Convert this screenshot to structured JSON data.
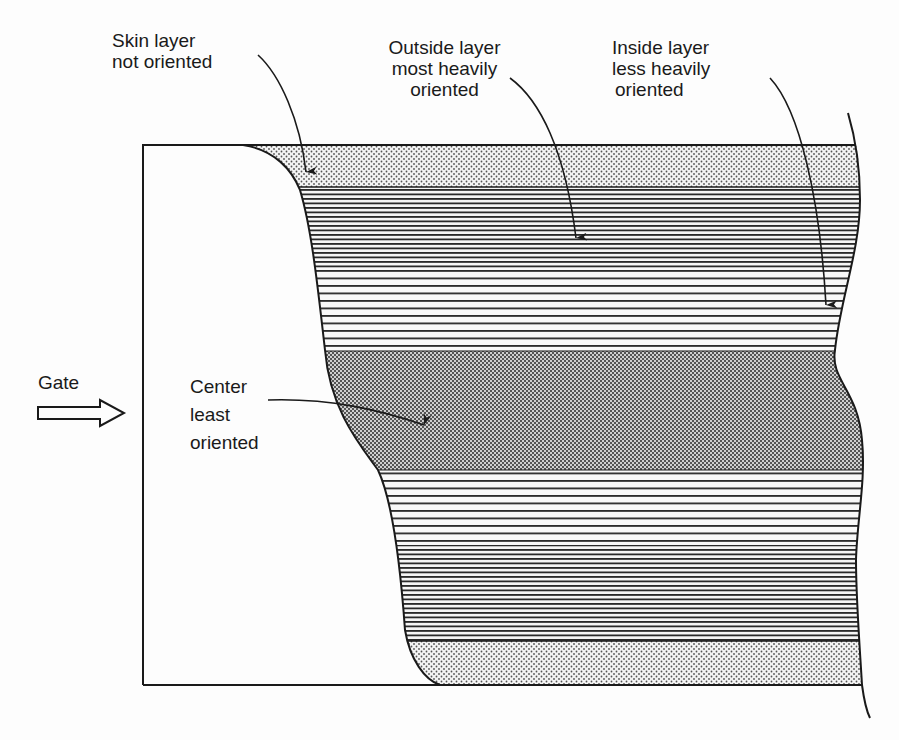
{
  "diagram": {
    "labels": {
      "skin": {
        "lines": [
          "Skin layer",
          "not oriented"
        ]
      },
      "outside": {
        "lines": [
          "Outside layer",
          "most heavily",
          "oriented"
        ]
      },
      "inside": {
        "lines": [
          "Inside layer",
          "less heavily",
          "oriented"
        ]
      },
      "center": {
        "lines": [
          "Center",
          "least",
          "oriented"
        ]
      },
      "gate": {
        "text": "Gate"
      }
    },
    "layers": [
      {
        "name": "skin-top",
        "pattern": "light-dots",
        "y_top": 145,
        "y_bottom": 187
      },
      {
        "name": "outside-top",
        "pattern": "dense-lines",
        "y_top": 187,
        "y_bottom": 268
      },
      {
        "name": "inside-top",
        "pattern": "sparse-lines",
        "y_top": 268,
        "y_bottom": 351
      },
      {
        "name": "center",
        "pattern": "dark-dots",
        "y_top": 351,
        "y_bottom": 470
      },
      {
        "name": "inside-bottom",
        "pattern": "sparse-lines",
        "y_top": 470,
        "y_bottom": 545
      },
      {
        "name": "outside-bottom",
        "pattern": "dense-lines",
        "y_top": 545,
        "y_bottom": 641
      },
      {
        "name": "skin-bottom",
        "pattern": "light-dots",
        "y_top": 641,
        "y_bottom": 685
      }
    ],
    "colors": {
      "ink": "#1a1a1a",
      "paper": "#fdfdfd"
    }
  }
}
